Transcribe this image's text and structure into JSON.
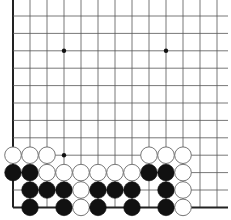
{
  "board": {
    "title": "Go board fragment (bottom-left region)",
    "columns": 13,
    "rows": 12,
    "origin_x": 13,
    "origin_y": 16,
    "spacing_x": 17,
    "spacing_y": 17.4,
    "left_edge": true,
    "bottom_edge": true,
    "line_color": "#555555",
    "edge_color": "#222222",
    "star_points": [
      [
        3,
        2
      ],
      [
        9,
        2
      ],
      [
        3,
        8
      ]
    ],
    "stones": [
      {
        "c": 0,
        "r": 8,
        "color": "white"
      },
      {
        "c": 1,
        "r": 8,
        "color": "white"
      },
      {
        "c": 2,
        "r": 8,
        "color": "white"
      },
      {
        "c": 8,
        "r": 8,
        "color": "white"
      },
      {
        "c": 9,
        "r": 8,
        "color": "white"
      },
      {
        "c": 10,
        "r": 8,
        "color": "white"
      },
      {
        "c": 0,
        "r": 9,
        "color": "black"
      },
      {
        "c": 1,
        "r": 9,
        "color": "black"
      },
      {
        "c": 2,
        "r": 9,
        "color": "white"
      },
      {
        "c": 3,
        "r": 9,
        "color": "white"
      },
      {
        "c": 4,
        "r": 9,
        "color": "white"
      },
      {
        "c": 5,
        "r": 9,
        "color": "white"
      },
      {
        "c": 6,
        "r": 9,
        "color": "white"
      },
      {
        "c": 7,
        "r": 9,
        "color": "white"
      },
      {
        "c": 8,
        "r": 9,
        "color": "black"
      },
      {
        "c": 9,
        "r": 9,
        "color": "black"
      },
      {
        "c": 10,
        "r": 9,
        "color": "white"
      },
      {
        "c": 1,
        "r": 10,
        "color": "black"
      },
      {
        "c": 2,
        "r": 10,
        "color": "black"
      },
      {
        "c": 3,
        "r": 10,
        "color": "black"
      },
      {
        "c": 4,
        "r": 10,
        "color": "white"
      },
      {
        "c": 5,
        "r": 10,
        "color": "black"
      },
      {
        "c": 6,
        "r": 10,
        "color": "black"
      },
      {
        "c": 7,
        "r": 10,
        "color": "black"
      },
      {
        "c": 9,
        "r": 10,
        "color": "black"
      },
      {
        "c": 10,
        "r": 10,
        "color": "white"
      },
      {
        "c": 1,
        "r": 11,
        "color": "black"
      },
      {
        "c": 3,
        "r": 11,
        "color": "black"
      },
      {
        "c": 4,
        "r": 11,
        "color": "white"
      },
      {
        "c": 5,
        "r": 11,
        "color": "black"
      },
      {
        "c": 7,
        "r": 11,
        "color": "black"
      },
      {
        "c": 9,
        "r": 11,
        "color": "black"
      },
      {
        "c": 10,
        "r": 11,
        "color": "white"
      }
    ]
  }
}
